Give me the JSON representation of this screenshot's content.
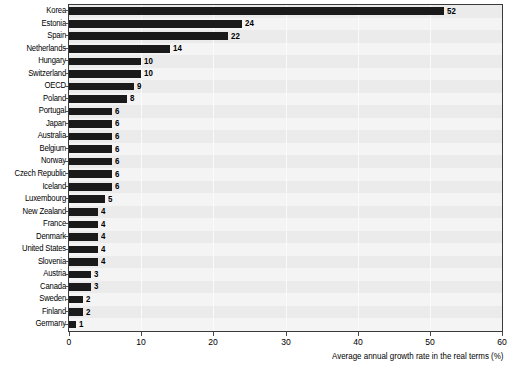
{
  "chart_data": {
    "type": "bar",
    "orientation": "horizontal",
    "title": "",
    "subtitle": "",
    "xlabel": "Average annual growth rate in the real terms (%)",
    "ylabel": "",
    "xlim": [
      0,
      60
    ],
    "xticks": [
      0,
      10,
      20,
      30,
      40,
      50,
      60
    ],
    "xtick_labels": [
      "0",
      "10",
      "20",
      "30",
      "40",
      "50",
      "60"
    ],
    "grid": true,
    "grid_axis": "x",
    "legend": null,
    "bar_color": "#1a1a1a",
    "plot_background": "#ebebeb",
    "value_labels": true,
    "categories": [
      "Korea",
      "Estonia",
      "Spain",
      "Netherlands",
      "Hungary",
      "Switzerland",
      "OECD",
      "Poland",
      "Portugal",
      "Japan",
      "Australia",
      "Belgium",
      "Norway",
      "Czech Republic",
      "Iceland",
      "Luxembourg",
      "New Zealand",
      "France",
      "Denmark",
      "United States",
      "Slovenia",
      "Austria",
      "Canada",
      "Sweden",
      "Finland",
      "Germany"
    ],
    "values": [
      52,
      24,
      22,
      14,
      10,
      10,
      9,
      8,
      6,
      6,
      6,
      6,
      6,
      6,
      6,
      5,
      4,
      4,
      4,
      4,
      4,
      3,
      3,
      2,
      2,
      1
    ],
    "value_text": [
      "52",
      "24",
      "22",
      "14",
      "10",
      "10",
      "9",
      "8",
      "6",
      "6",
      "6",
      "6",
      "6",
      "6",
      "6",
      "5",
      "4",
      "4",
      "4",
      "4",
      "4",
      "3",
      "3",
      "2",
      "2",
      "1"
    ]
  }
}
